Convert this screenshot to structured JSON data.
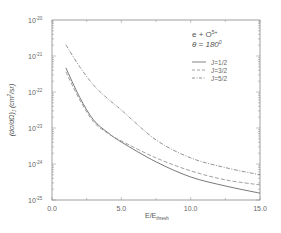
{
  "chart_data": {
    "type": "line",
    "title": "",
    "annotations": [
      "e + O5+",
      "θ = 180°"
    ],
    "annotation_reaction": {
      "base": "e + O",
      "sup": "5+"
    },
    "annotation_angle": {
      "base": "θ = 180",
      "sup": "0"
    },
    "xlabel": {
      "base": "E/E",
      "sub": "thresh"
    },
    "ylabel": "(dσ/dΩ)J (cm²/sr)",
    "ylabel_parts": {
      "a": "(dσ/dΩ)",
      "sub": "J",
      "b": " (cm",
      "sup": "2",
      "c": "/sr)"
    },
    "xlim": [
      0.0,
      15.0
    ],
    "ylim": [
      1e-25,
      1e-20
    ],
    "yscale": "log",
    "x_ticks": [
      "0.0",
      "5.0",
      "10.0",
      "15.0"
    ],
    "y_ticks": [
      {
        "base": "10",
        "exp": "-20"
      },
      {
        "base": "10",
        "exp": "-21"
      },
      {
        "base": "10",
        "exp": "-22"
      },
      {
        "base": "10",
        "exp": "-23"
      },
      {
        "base": "10",
        "exp": "-24"
      },
      {
        "base": "10",
        "exp": "-25"
      }
    ],
    "legend_position": "upper right",
    "grid": false,
    "x": [
      1.0,
      2.0,
      3.0,
      4.0,
      5.0,
      7.5,
      10.0,
      12.5,
      15.0
    ],
    "series": [
      {
        "name": "J=1/2",
        "style": "solid",
        "log10_values": [
          -21.33,
          -22.15,
          -22.78,
          -23.12,
          -23.39,
          -23.94,
          -24.36,
          -24.61,
          -24.81
        ]
      },
      {
        "name": "J=3/2",
        "style": "dashed",
        "log10_values": [
          -21.44,
          -22.22,
          -22.83,
          -23.14,
          -23.36,
          -23.83,
          -24.19,
          -24.44,
          -24.58
        ]
      },
      {
        "name": "J=5/2",
        "style": "dash-dot",
        "log10_values": [
          -20.69,
          -21.3,
          -21.81,
          -22.18,
          -22.5,
          -23.33,
          -23.83,
          -24.1,
          -24.3
        ]
      }
    ]
  },
  "colors": {
    "axis": "#777777",
    "line": "#666666",
    "text": "#555555"
  }
}
